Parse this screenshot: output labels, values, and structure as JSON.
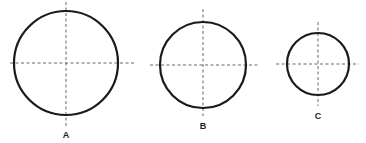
{
  "diagram": {
    "circles": [
      {
        "id": "A",
        "label": "A",
        "relative_size": "large"
      },
      {
        "id": "B",
        "label": "B",
        "relative_size": "medium"
      },
      {
        "id": "C",
        "label": "C",
        "relative_size": "small"
      }
    ],
    "colors": {
      "outline": "#1a1a1a",
      "centerline": "#555555",
      "background": "#ffffff"
    }
  }
}
